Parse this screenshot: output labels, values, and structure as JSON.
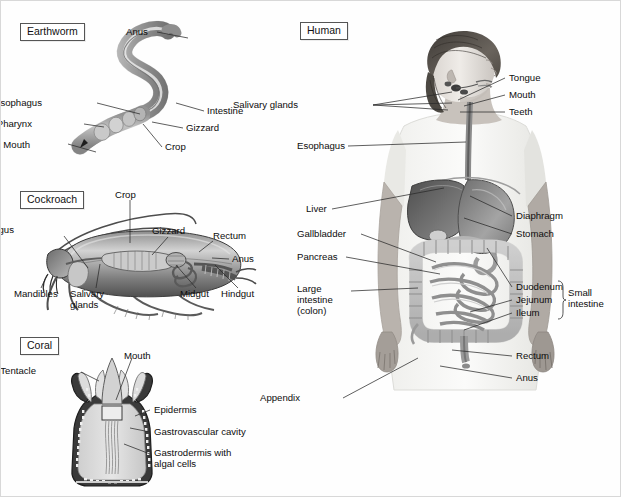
{
  "figure": {
    "panels": [
      {
        "id": "earthworm",
        "tag": "Earthworm",
        "labels": [
          {
            "name": "anus",
            "text": "Anus"
          },
          {
            "name": "esophagus",
            "text": "Esophagus"
          },
          {
            "name": "pharynx",
            "text": "Pharynx"
          },
          {
            "name": "mouth",
            "text": "Mouth"
          },
          {
            "name": "intestine",
            "text": "Intestine"
          },
          {
            "name": "gizzard",
            "text": "Gizzard"
          },
          {
            "name": "crop",
            "text": "Crop"
          }
        ]
      },
      {
        "id": "cockroach",
        "tag": "Cockroach",
        "labels": [
          {
            "name": "crop",
            "text": "Crop"
          },
          {
            "name": "esophagus",
            "text": "Esophagus"
          },
          {
            "name": "gizzard",
            "text": "Gizzard"
          },
          {
            "name": "rectum",
            "text": "Rectum"
          },
          {
            "name": "anus",
            "text": "Anus"
          },
          {
            "name": "mandibles",
            "text": "Mandibles"
          },
          {
            "name": "salivary-glands",
            "text": "Salivary glands"
          },
          {
            "name": "salivary-glands-line1",
            "text": "Salivary"
          },
          {
            "name": "salivary-glands-line2",
            "text": "glands"
          },
          {
            "name": "midgut",
            "text": "Midgut"
          },
          {
            "name": "hindgut",
            "text": "Hindgut"
          }
        ]
      },
      {
        "id": "coral",
        "tag": "Coral",
        "labels": [
          {
            "name": "mouth",
            "text": "Mouth"
          },
          {
            "name": "tentacle",
            "text": "Tentacle"
          },
          {
            "name": "epidermis",
            "text": "Epidermis"
          },
          {
            "name": "gastrovascular-cavity",
            "text": "Gastrovascular cavity"
          },
          {
            "name": "gastrodermis",
            "text": "Gastrodermis with algal cells"
          }
        ]
      },
      {
        "id": "human",
        "tag": "Human",
        "labels": [
          {
            "name": "tongue",
            "text": "Tongue"
          },
          {
            "name": "mouth",
            "text": "Mouth"
          },
          {
            "name": "teeth",
            "text": "Teeth"
          },
          {
            "name": "salivary-glands",
            "text": "Salivary glands"
          },
          {
            "name": "esophagus",
            "text": "Esophagus"
          },
          {
            "name": "liver",
            "text": "Liver"
          },
          {
            "name": "gallbladder",
            "text": "Gallbladder"
          },
          {
            "name": "pancreas",
            "text": "Pancreas"
          },
          {
            "name": "large-intestine",
            "text": "Large intestine (colon)"
          },
          {
            "name": "diaphragm",
            "text": "Diaphragm"
          },
          {
            "name": "stomach",
            "text": "Stomach"
          },
          {
            "name": "duodenum",
            "text": "Duodenum"
          },
          {
            "name": "jejunum",
            "text": "Jejunum"
          },
          {
            "name": "ileum",
            "text": "Ileum"
          },
          {
            "name": "small-intestine",
            "text": "Small intestine"
          },
          {
            "name": "rectum",
            "text": "Rectum"
          },
          {
            "name": "anus",
            "text": "Anus"
          },
          {
            "name": "appendix",
            "text": "Appendix"
          }
        ]
      }
    ]
  },
  "earthworm": {
    "tag": "Earthworm",
    "anus": "Anus",
    "esophagus": "Esophagus",
    "pharynx": "Pharynx",
    "mouth": "Mouth",
    "intestine": "Intestine",
    "gizzard": "Gizzard",
    "crop": "Crop"
  },
  "cockroach": {
    "tag": "Cockroach",
    "crop": "Crop",
    "esophagus": "Esophagus",
    "gizzard": "Gizzard",
    "rectum": "Rectum",
    "anus": "Anus",
    "mandibles": "Mandibles",
    "salivary_line1": "Salivary",
    "salivary_line2": "glands",
    "midgut": "Midgut",
    "hindgut": "Hindgut"
  },
  "coral": {
    "tag": "Coral",
    "mouth": "Mouth",
    "tentacle": "Tentacle",
    "epidermis": "Epidermis",
    "gastrovascular": "Gastrovascular cavity",
    "gastrodermis_line1": "Gastrodermis with",
    "gastrodermis_line2": "algal cells"
  },
  "human": {
    "tag": "Human",
    "tongue": "Tongue",
    "mouth": "Mouth",
    "teeth": "Teeth",
    "salivary": "Salivary glands",
    "esophagus": "Esophagus",
    "liver": "Liver",
    "gallbladder": "Gallbladder",
    "pancreas": "Pancreas",
    "large_line1": "Large",
    "large_line2": "intestine",
    "large_line3": "(colon)",
    "diaphragm": "Diaphragm",
    "stomach": "Stomach",
    "duodenum": "Duodenum",
    "jejunum": "Jejunum",
    "ileum": "Ileum",
    "small_line1": "Small",
    "small_line2": "intestine",
    "rectum": "Rectum",
    "anus": "Anus",
    "appendix": "Appendix"
  },
  "colors": {
    "ink": "#0d0d0d",
    "leader": "#2a2a2a",
    "tag_border": "#555555",
    "organ_dark": "#6f6f6f",
    "organ_mid": "#9a9a9a",
    "organ_light": "#cfcfcf",
    "background": "#fefefe"
  }
}
